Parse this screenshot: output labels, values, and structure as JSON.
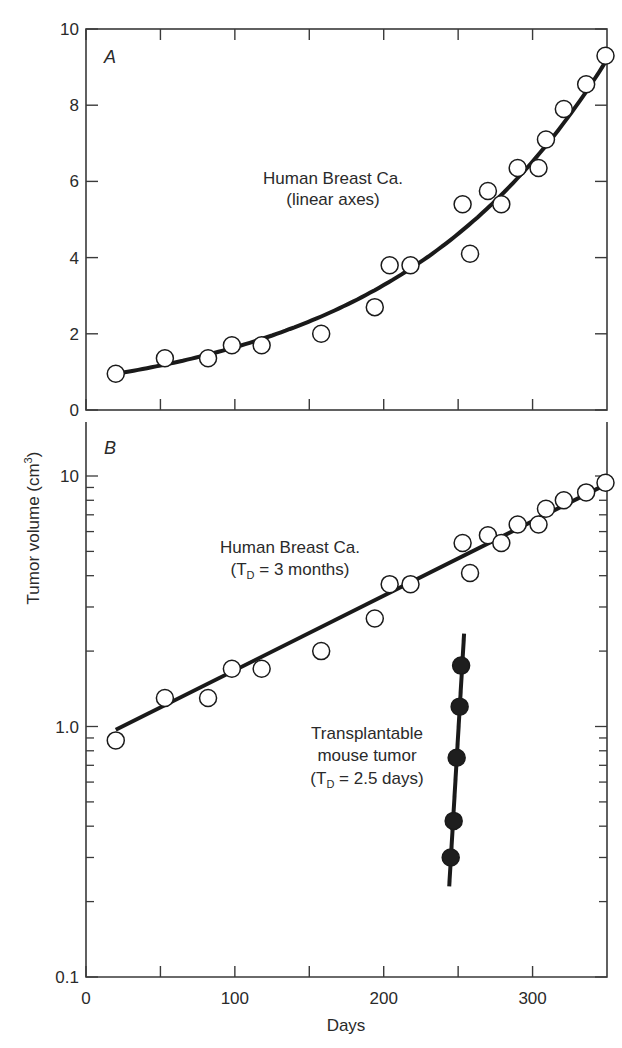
{
  "chart_data": [
    {
      "panel": "A",
      "type": "scatter",
      "title": "",
      "annotation": [
        "Human Breast Ca.",
        "(linear axes)"
      ],
      "xlabel": "Days",
      "ylabel": "Tumor volume (cm³)",
      "xlim": [
        0,
        350
      ],
      "ylim": [
        0,
        10
      ],
      "yscale": "linear",
      "xticks": [
        0,
        50,
        100,
        150,
        200,
        250,
        300
      ],
      "yticks": [
        0,
        2,
        4,
        6,
        8,
        10
      ],
      "ytick_labels": [
        "0",
        "2",
        "4",
        "6",
        "8",
        "10"
      ],
      "grid": false,
      "series": [
        {
          "name": "Human Breast Ca.",
          "marker": "open-circle",
          "x": [
            20,
            53,
            82,
            98,
            118,
            158,
            194,
            204,
            218,
            253,
            258,
            270,
            279,
            290,
            304,
            309,
            321,
            336,
            349
          ],
          "y": [
            0.95,
            1.36,
            1.36,
            1.7,
            1.7,
            2.0,
            2.7,
            3.8,
            3.8,
            5.4,
            4.1,
            5.75,
            5.4,
            6.35,
            6.35,
            7.1,
            7.9,
            8.55,
            9.3
          ]
        }
      ],
      "fit_curve": {
        "type": "exponential",
        "x_start": 20,
        "x_end": 350,
        "y_start": 0.95,
        "y_end": 9.2
      }
    },
    {
      "panel": "B",
      "type": "scatter",
      "title": "",
      "xlabel": "Days",
      "ylabel": "Tumor volume (cm³)",
      "xlim": [
        0,
        350
      ],
      "ylim": [
        0.1,
        16
      ],
      "yscale": "log",
      "xticks": [
        0,
        50,
        100,
        150,
        200,
        250,
        300
      ],
      "xtick_labels": [
        "0",
        "100",
        "200",
        "300"
      ],
      "yticks": [
        0.1,
        1.0,
        10
      ],
      "ytick_labels": [
        "0.1",
        "1.0",
        "10"
      ],
      "grid": false,
      "series": [
        {
          "name": "Human Breast Ca. (TD = 3 months)",
          "marker": "open-circle",
          "x": [
            20,
            53,
            82,
            98,
            118,
            158,
            194,
            204,
            218,
            253,
            258,
            270,
            279,
            290,
            304,
            309,
            321,
            336,
            349
          ],
          "y": [
            0.88,
            1.3,
            1.3,
            1.7,
            1.7,
            2.0,
            2.7,
            3.7,
            3.7,
            5.4,
            4.1,
            5.8,
            5.4,
            6.4,
            6.4,
            7.4,
            8.0,
            8.6,
            9.4
          ],
          "fit_line": {
            "x_start": 20,
            "x_end": 350,
            "y_start": 0.97,
            "y_end": 9.3
          }
        },
        {
          "name": "Transplantable mouse tumor (TD = 2.5 days)",
          "marker": "filled-circle",
          "x": [
            245,
            247,
            249,
            251,
            252
          ],
          "y": [
            0.3,
            0.42,
            0.75,
            1.2,
            1.75
          ],
          "fit_line": {
            "x_start": 244,
            "x_end": 254,
            "y_start": 0.23,
            "y_end": 2.35
          }
        }
      ],
      "annotations": [
        [
          "Human Breast Ca.",
          "(T_D = 3 months)"
        ],
        [
          "Transplantable",
          "mouse tumor",
          "(T_D = 2.5 days)"
        ]
      ]
    }
  ],
  "labels": {
    "panel_a": "A",
    "panel_b": "B",
    "x_axis_title": "Days",
    "y_axis_title": "Tumor volume (cm",
    "y_axis_sup": "3",
    "y_axis_close": ")",
    "a_annot_1": "Human Breast Ca.",
    "a_annot_2": "(linear axes)",
    "b_annot_1": "Human Breast Ca.",
    "b_annot_2_pre": "(T",
    "b_annot_2_sub": "D",
    "b_annot_2_post": " = 3 months)",
    "m_annot_1": "Transplantable",
    "m_annot_2": "mouse tumor",
    "m_annot_3_pre": "(T",
    "m_annot_3_sub": "D",
    "m_annot_3_post": " = 2.5 days)",
    "a_yticks": [
      "0",
      "2",
      "4",
      "6",
      "8",
      "10"
    ],
    "b_yticks": [
      "0.1",
      "1.0",
      "10"
    ],
    "xticks": [
      "0",
      "100",
      "200",
      "300"
    ]
  },
  "colors": {
    "axis": "#3a3a3a",
    "line": "#1a1a1a",
    "marker_fill_open": "#ffffff",
    "marker_fill_closed": "#1e1e1e"
  }
}
